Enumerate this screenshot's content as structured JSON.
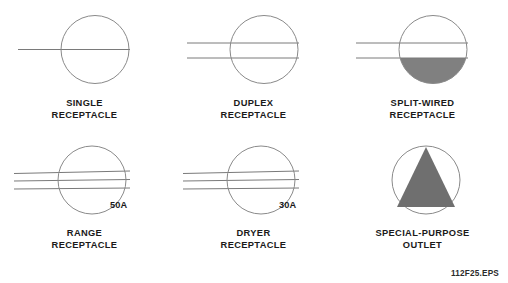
{
  "figure": {
    "code": "112F25.EPS",
    "colors": {
      "stroke": "#7a7a7a",
      "fill_gray": "#808080",
      "text": "#1a1a1a",
      "background": "#ffffff"
    }
  },
  "symbols": [
    {
      "id": "single-receptacle",
      "caption_lines": [
        "SINGLE",
        "RECEPTACLE"
      ],
      "rating": "",
      "line_count": 1,
      "fill": "none"
    },
    {
      "id": "duplex-receptacle",
      "caption_lines": [
        "DUPLEX",
        "RECEPTACLE"
      ],
      "rating": "",
      "line_count": 2,
      "fill": "none"
    },
    {
      "id": "split-wired-receptacle",
      "caption_lines": [
        "SPLIT-WIRED",
        "RECEPTACLE"
      ],
      "rating": "",
      "line_count": 2,
      "fill": "half-bottom"
    },
    {
      "id": "range-receptacle",
      "caption_lines": [
        "RANGE",
        "RECEPTACLE"
      ],
      "rating": "50A",
      "line_count": 3,
      "fill": "none"
    },
    {
      "id": "dryer-receptacle",
      "caption_lines": [
        "DRYER",
        "RECEPTACLE"
      ],
      "rating": "30A",
      "line_count": 3,
      "fill": "none"
    },
    {
      "id": "special-purpose-outlet",
      "caption_lines": [
        "SPECIAL-PURPOSE",
        "OUTLET"
      ],
      "rating": "",
      "line_count": 0,
      "fill": "triangle"
    }
  ]
}
